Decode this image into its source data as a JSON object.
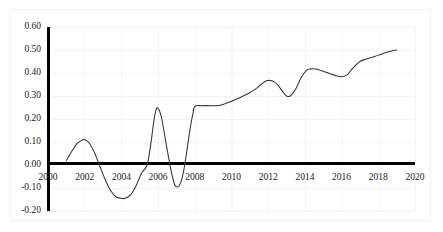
{
  "chart_data": {
    "type": "line",
    "title": "",
    "subtitle": "",
    "xlabel": "",
    "ylabel": "",
    "xlim": [
      2000,
      2020
    ],
    "ylim": [
      -0.2,
      0.6
    ],
    "grid": true,
    "legend": null,
    "legend_position": "none",
    "line_color": "#333333",
    "axis_color": "#000000",
    "grid_color": "#f2f2f2",
    "xticks": [
      2000,
      2002,
      2004,
      2006,
      2008,
      2010,
      2012,
      2014,
      2016,
      2018,
      2020
    ],
    "xtick_labels": [
      "2000",
      "2002",
      "2004",
      "2006",
      "2008",
      "2010",
      "2012",
      "2014",
      "2016",
      "2018",
      "2020"
    ],
    "yticks": [
      -0.2,
      -0.1,
      0.0,
      0.1,
      0.2,
      0.3,
      0.4,
      0.5,
      0.6
    ],
    "ytick_labels": [
      "-0.20",
      "-0.10",
      "0.00",
      "0.10",
      "0.20",
      "0.30",
      "0.40",
      "0.50",
      "0.60"
    ],
    "series": [
      {
        "name": "series-1",
        "x": [
          2001.0,
          2001.3,
          2001.6,
          2001.9,
          2002.0,
          2002.2,
          2002.5,
          2002.8,
          2003.1,
          2003.4,
          2003.7,
          2004.0,
          2004.2,
          2004.5,
          2004.8,
          2005.1,
          2005.4,
          2005.6,
          2005.75,
          2005.9,
          2006.05,
          2006.2,
          2006.4,
          2006.6,
          2006.75,
          2006.9,
          2007.0,
          2007.15,
          2007.3,
          2007.45,
          2007.6,
          2007.75,
          2007.9,
          2008.0,
          2008.4,
          2008.9,
          2009.3,
          2009.7,
          2010.1,
          2010.5,
          2010.9,
          2011.3,
          2011.6,
          2011.9,
          2012.2,
          2012.5,
          2012.8,
          2013.0,
          2013.2,
          2013.5,
          2013.8,
          2014.1,
          2014.3,
          2014.6,
          2015.0,
          2015.4,
          2015.7,
          2116.0,
          2016.0,
          2016.3,
          2016.6,
          2017.0,
          2017.4,
          2017.8,
          2018.2,
          2018.6,
          2019.0
        ],
        "y": [
          0.02,
          0.06,
          0.095,
          0.11,
          0.11,
          0.1,
          0.06,
          0.0,
          -0.06,
          -0.11,
          -0.138,
          -0.145,
          -0.145,
          -0.13,
          -0.09,
          -0.035,
          0.0,
          0.09,
          0.18,
          0.243,
          0.24,
          0.2,
          0.11,
          0.02,
          -0.04,
          -0.085,
          -0.095,
          -0.09,
          -0.06,
          0.0,
          0.08,
          0.16,
          0.225,
          0.255,
          0.258,
          0.258,
          0.259,
          0.268,
          0.28,
          0.295,
          0.31,
          0.33,
          0.35,
          0.366,
          0.366,
          0.35,
          0.318,
          0.3,
          0.3,
          0.33,
          0.38,
          0.412,
          0.418,
          0.417,
          0.408,
          0.396,
          0.388,
          0.384,
          0.384,
          0.392,
          0.42,
          0.45,
          0.462,
          0.472,
          0.483,
          0.493,
          0.5
        ]
      }
    ],
    "annotations": []
  }
}
